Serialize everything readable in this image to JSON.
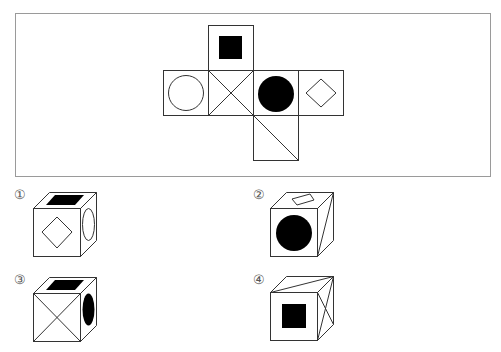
{
  "question": {
    "frame": {
      "x": 15,
      "y": 13,
      "w": 475,
      "h": 163,
      "stroke": "#999999"
    },
    "net": {
      "cell_size": 45,
      "faces": [
        {
          "id": "top",
          "pattern": "black-square",
          "x": 208,
          "y": 25
        },
        {
          "id": "row-1",
          "pattern": "white-circle",
          "x": 163,
          "y": 70
        },
        {
          "id": "row-2",
          "pattern": "x-cross",
          "x": 208,
          "y": 70
        },
        {
          "id": "row-3",
          "pattern": "black-circle",
          "x": 253,
          "y": 70
        },
        {
          "id": "row-4",
          "pattern": "white-diamond",
          "x": 298,
          "y": 70
        },
        {
          "id": "bottom",
          "pattern": "diagonal",
          "x": 253,
          "y": 115
        }
      ]
    }
  },
  "options": [
    {
      "label": "①",
      "front": "white-diamond",
      "top": "black-square",
      "right": "white-circle"
    },
    {
      "label": "②",
      "front": "black-circle",
      "top": "white-diamond",
      "right": "diagonal"
    },
    {
      "label": "③",
      "front": "x-cross",
      "top": "black-square",
      "right": "black-circle"
    },
    {
      "label": "④",
      "front": "black-square",
      "top": "diagonal",
      "right": "x-cross"
    }
  ],
  "colors": {
    "line": "#333333",
    "fill": "#000000"
  }
}
